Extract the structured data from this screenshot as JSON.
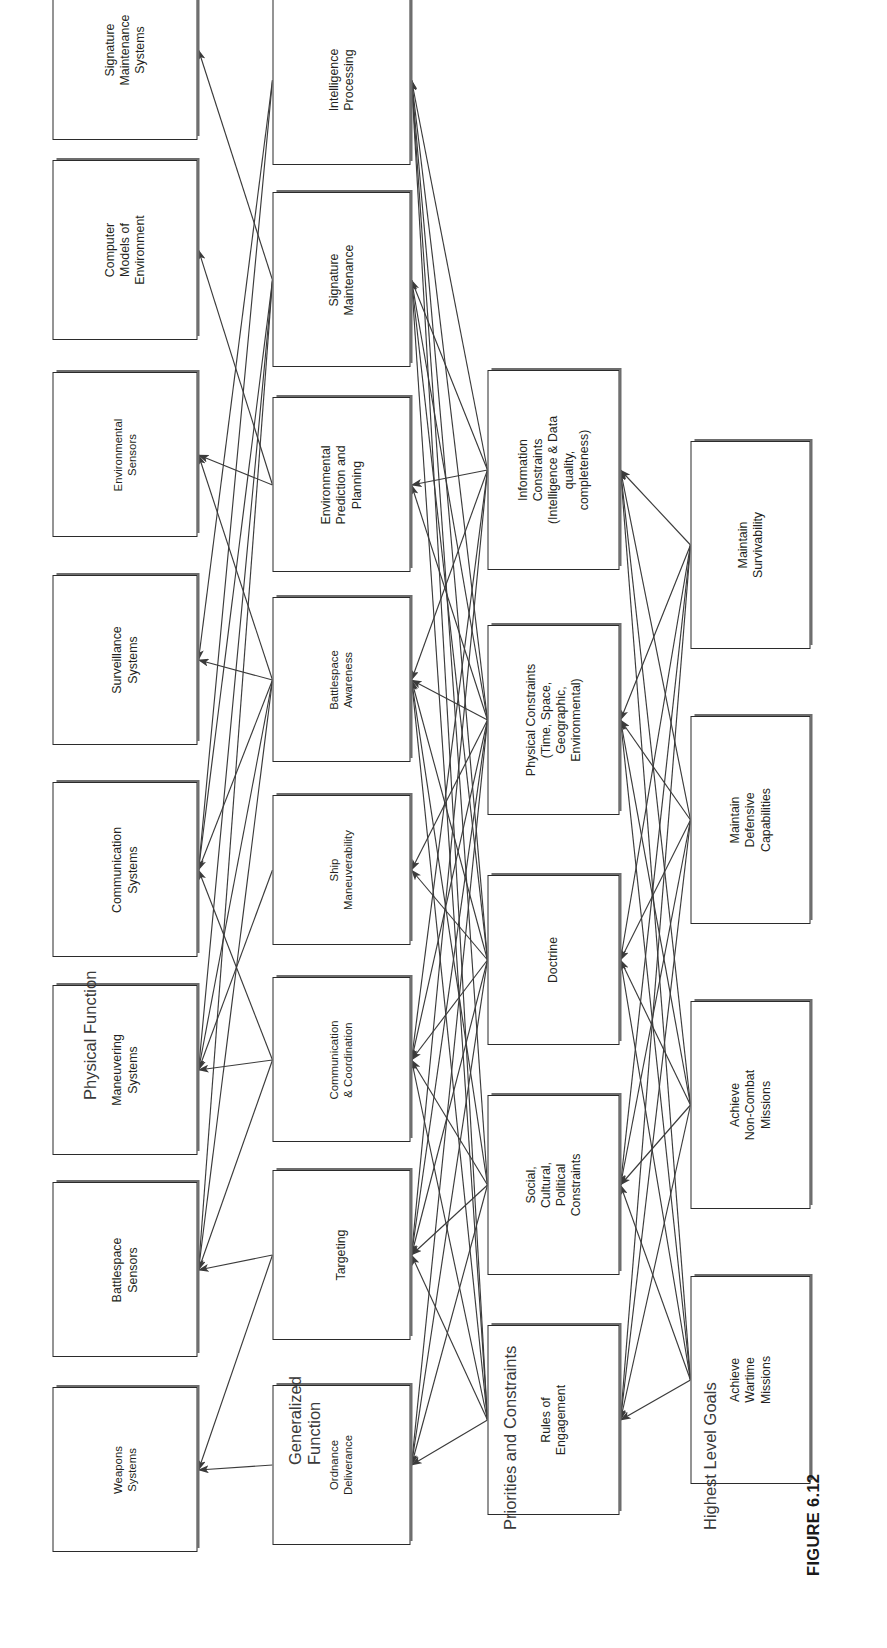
{
  "figure": {
    "caption": "FIGURE 6.12"
  },
  "tiers": [
    {
      "id": "goals",
      "label": "Highest Level Goals"
    },
    {
      "id": "priorities",
      "label": "Priorities and Constraints"
    },
    {
      "id": "function",
      "label": "Generalized\nFunction"
    },
    {
      "id": "physical",
      "label": "Physical Function"
    }
  ],
  "colors": {
    "box_border": "#2b2b2b",
    "box_fill": "#ffffff",
    "box_shadow": "#6d6d6d",
    "edge": "#3b3b3b",
    "text": "#231f20",
    "label_text": "#3a3a3a"
  },
  "columns": {
    "goals": {
      "title": "Highest Level Goals",
      "nodes": [
        {
          "id": "g1",
          "label": "Achieve\nWartime\nMissions"
        },
        {
          "id": "g2",
          "label": "Achieve\nNon-Combat\nMissions"
        },
        {
          "id": "g3",
          "label": "Maintain\nDefensive\nCapabilities"
        },
        {
          "id": "g4",
          "label": "Maintain\nSurvivability"
        }
      ]
    },
    "priorities": {
      "title": "Priorities and Constraints",
      "nodes": [
        {
          "id": "p1",
          "label": "Rules of\nEngagement"
        },
        {
          "id": "p2",
          "label": "Social,\nCultural,\nPolitical\nConstraints"
        },
        {
          "id": "p3",
          "label": "Doctrine"
        },
        {
          "id": "p4",
          "label": "Physical Constraints\n(Time, Space,\nGeographic,\nEnvironmental)"
        },
        {
          "id": "p5",
          "label": "Information\nConstraints\n(Intelligence & Data\nquality,\ncompleteness)"
        }
      ]
    },
    "function": {
      "title": "Generalized Function",
      "nodes": [
        {
          "id": "f1",
          "label": "Ordnance\nDeliverance"
        },
        {
          "id": "f2",
          "label": "Targeting"
        },
        {
          "id": "f3",
          "label": "Communication\n& Coordination"
        },
        {
          "id": "f4",
          "label": "Ship\nManeuverability"
        },
        {
          "id": "f5",
          "label": "Battlespace\nAwareness"
        },
        {
          "id": "f6",
          "label": "Environmental\nPrediction and\nPlanning"
        },
        {
          "id": "f7",
          "label": "Signature\nMaintenance"
        },
        {
          "id": "f8",
          "label": "Intelligence\nProcessing"
        }
      ]
    },
    "physical": {
      "title": "Physical Function",
      "nodes": [
        {
          "id": "h1",
          "label": "Weapons\nSystems"
        },
        {
          "id": "h2",
          "label": "Battlespace\nSensors"
        },
        {
          "id": "h3",
          "label": "Maneuvering\nSystems"
        },
        {
          "id": "h4",
          "label": "Communication\nSystems"
        },
        {
          "id": "h5",
          "label": "Surveillance\nSystems"
        },
        {
          "id": "h6",
          "label": "Environmental\nSensors"
        },
        {
          "id": "h7",
          "label": "Computer\nModels of\nEnvironment"
        },
        {
          "id": "h8",
          "label": "Signature\nMaintenance\nSystems"
        }
      ]
    }
  },
  "edges": {
    "goals_to_priorities": [
      [
        "g1",
        "p1"
      ],
      [
        "g1",
        "p2"
      ],
      [
        "g1",
        "p3"
      ],
      [
        "g1",
        "p4"
      ],
      [
        "g1",
        "p5"
      ],
      [
        "g2",
        "p1"
      ],
      [
        "g2",
        "p2"
      ],
      [
        "g2",
        "p3"
      ],
      [
        "g2",
        "p4"
      ],
      [
        "g2",
        "p5"
      ],
      [
        "g3",
        "p1"
      ],
      [
        "g3",
        "p2"
      ],
      [
        "g3",
        "p3"
      ],
      [
        "g3",
        "p4"
      ],
      [
        "g3",
        "p5"
      ],
      [
        "g4",
        "p1"
      ],
      [
        "g4",
        "p2"
      ],
      [
        "g4",
        "p3"
      ],
      [
        "g4",
        "p4"
      ],
      [
        "g4",
        "p5"
      ]
    ],
    "priorities_to_function": [
      [
        "p1",
        "f1"
      ],
      [
        "p1",
        "f2"
      ],
      [
        "p1",
        "f3"
      ],
      [
        "p1",
        "f5"
      ],
      [
        "p1",
        "f7"
      ],
      [
        "p1",
        "f8"
      ],
      [
        "p2",
        "f1"
      ],
      [
        "p2",
        "f2"
      ],
      [
        "p2",
        "f3"
      ],
      [
        "p2",
        "f5"
      ],
      [
        "p2",
        "f8"
      ],
      [
        "p3",
        "f1"
      ],
      [
        "p3",
        "f2"
      ],
      [
        "p3",
        "f3"
      ],
      [
        "p3",
        "f4"
      ],
      [
        "p3",
        "f5"
      ],
      [
        "p3",
        "f7"
      ],
      [
        "p3",
        "f8"
      ],
      [
        "p4",
        "f1"
      ],
      [
        "p4",
        "f2"
      ],
      [
        "p4",
        "f3"
      ],
      [
        "p4",
        "f4"
      ],
      [
        "p4",
        "f5"
      ],
      [
        "p4",
        "f6"
      ],
      [
        "p4",
        "f7"
      ],
      [
        "p4",
        "f8"
      ],
      [
        "p5",
        "f2"
      ],
      [
        "p5",
        "f3"
      ],
      [
        "p5",
        "f5"
      ],
      [
        "p5",
        "f6"
      ],
      [
        "p5",
        "f7"
      ],
      [
        "p5",
        "f8"
      ]
    ],
    "function_to_physical": [
      [
        "f1",
        "h1"
      ],
      [
        "f2",
        "h1"
      ],
      [
        "f2",
        "h2"
      ],
      [
        "f3",
        "h2"
      ],
      [
        "f3",
        "h4"
      ],
      [
        "f3",
        "h3"
      ],
      [
        "f4",
        "h3"
      ],
      [
        "f5",
        "h2"
      ],
      [
        "f5",
        "h3"
      ],
      [
        "f5",
        "h4"
      ],
      [
        "f5",
        "h5"
      ],
      [
        "f5",
        "h6"
      ],
      [
        "f6",
        "h6"
      ],
      [
        "f6",
        "h7"
      ],
      [
        "f7",
        "h2"
      ],
      [
        "f7",
        "h3"
      ],
      [
        "f7",
        "h4"
      ],
      [
        "f7",
        "h8"
      ],
      [
        "f8",
        "h4"
      ],
      [
        "f8",
        "h5"
      ]
    ]
  }
}
